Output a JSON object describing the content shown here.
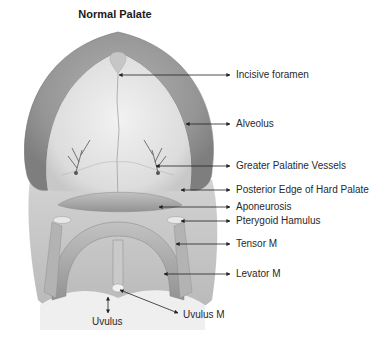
{
  "title": "Normal Palate",
  "labels": [
    {
      "id": "incisive-foramen",
      "text": "Incisive foramen",
      "x": 235,
      "y": 69,
      "tx": 118,
      "ty": 75
    },
    {
      "id": "alveolus",
      "text": "Alveolus",
      "x": 235,
      "y": 118,
      "tx": 185,
      "ty": 124
    },
    {
      "id": "greater-palatine-vessels",
      "text": "Greater Palatine Vessels",
      "x": 235,
      "y": 160,
      "tx": 155,
      "ty": 166
    },
    {
      "id": "posterior-edge-hard-palate",
      "text": "Posterior Edge of Hard Palate",
      "x": 235,
      "y": 184,
      "tx": 180,
      "ty": 190
    },
    {
      "id": "aponeurosis",
      "text": "Aponeurosis",
      "x": 235,
      "y": 201,
      "tx": 158,
      "ty": 207
    },
    {
      "id": "pterygoid-hamulus",
      "text": "Pterygoid Hamulus",
      "x": 235,
      "y": 215,
      "tx": 180,
      "ty": 221
    },
    {
      "id": "tensor-m",
      "text": "Tensor M",
      "x": 235,
      "y": 238,
      "tx": 175,
      "ty": 244
    },
    {
      "id": "levator-m",
      "text": "Levator M",
      "x": 235,
      "y": 268,
      "tx": 163,
      "ty": 274
    }
  ],
  "bottom_labels": {
    "uvulus": "Uvulus",
    "uvulus_m": "Uvulus M"
  },
  "colors": {
    "alveolus": "#9a9a9a",
    "hard_palate": "#e6e6e6",
    "soft_tissue": "#c4c4c4",
    "muscle": "#a8a8a8",
    "arrow": "#222222",
    "text": "#2a2a2a"
  }
}
